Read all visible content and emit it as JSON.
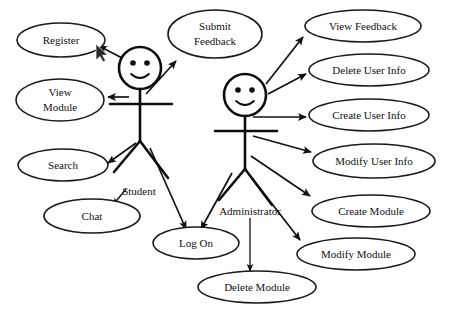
{
  "diagram": {
    "type": "uml-use-case-diagram",
    "background_color": "#ffffff",
    "stroke_color": "#111111",
    "actors": [
      {
        "id": "student",
        "label": "Student",
        "head": {
          "cx": 140,
          "cy": 68,
          "r": 21
        },
        "label_pos": {
          "x": 139,
          "y": 192
        }
      },
      {
        "id": "administrator",
        "label": "Administrator",
        "head": {
          "cx": 245,
          "cy": 95,
          "r": 21
        },
        "label_pos": {
          "x": 250,
          "y": 212
        }
      }
    ],
    "use_cases": [
      {
        "id": "register",
        "label": "Register",
        "lines": [
          "Register"
        ],
        "cx": 61,
        "cy": 40,
        "rx": 44,
        "ry": 17,
        "actor": "student"
      },
      {
        "id": "submit-feedback",
        "label": "Submit Feedback",
        "lines": [
          "Submit",
          "Feedback"
        ],
        "cx": 215,
        "cy": 34,
        "rx": 47,
        "ry": 24,
        "actor": "student"
      },
      {
        "id": "view-module",
        "label": "View Module",
        "lines": [
          "View",
          "Module"
        ],
        "cx": 60,
        "cy": 100,
        "rx": 44,
        "ry": 21,
        "actor": "student"
      },
      {
        "id": "search",
        "label": "Search",
        "lines": [
          "Search"
        ],
        "cx": 63,
        "cy": 165,
        "rx": 45,
        "ry": 16,
        "actor": "student"
      },
      {
        "id": "chat",
        "label": "Chat",
        "lines": [
          "Chat"
        ],
        "cx": 92,
        "cy": 216,
        "rx": 48,
        "ry": 17,
        "actor": "student"
      },
      {
        "id": "log-on",
        "label": "Log On",
        "lines": [
          "Log On"
        ],
        "cx": 196,
        "cy": 243,
        "rx": 43,
        "ry": 16,
        "actor": "both"
      },
      {
        "id": "view-feedback",
        "label": "View Feedback",
        "lines": [
          "View Feedback"
        ],
        "cx": 363,
        "cy": 26,
        "rx": 58,
        "ry": 16,
        "actor": "administrator"
      },
      {
        "id": "delete-user-info",
        "label": "Delete User Info",
        "lines": [
          "Delete User Info"
        ],
        "cx": 369,
        "cy": 70,
        "rx": 60,
        "ry": 16,
        "actor": "administrator"
      },
      {
        "id": "create-user-info",
        "label": "Create User Info",
        "lines": [
          "Create User Info"
        ],
        "cx": 369,
        "cy": 115,
        "rx": 60,
        "ry": 16,
        "actor": "administrator"
      },
      {
        "id": "modify-user-info",
        "label": "Modify User Info",
        "lines": [
          "Modify User Info"
        ],
        "cx": 374,
        "cy": 161,
        "rx": 61,
        "ry": 17,
        "actor": "administrator"
      },
      {
        "id": "create-module",
        "label": "Create Module",
        "lines": [
          "Create Module"
        ],
        "cx": 371,
        "cy": 211,
        "rx": 59,
        "ry": 16,
        "actor": "administrator"
      },
      {
        "id": "modify-module",
        "label": "Modify Module",
        "lines": [
          "Modify Module"
        ],
        "cx": 356,
        "cy": 254,
        "rx": 59,
        "ry": 16,
        "actor": "administrator"
      },
      {
        "id": "delete-module",
        "label": "Delete Module",
        "lines": [
          "Delete Module"
        ],
        "cx": 257,
        "cy": 287,
        "rx": 59,
        "ry": 16,
        "actor": "administrator"
      }
    ],
    "associations": [
      {
        "id": "student-register",
        "from": "student",
        "to": "register",
        "label": ""
      },
      {
        "id": "student-submit-feedback",
        "from": "student",
        "to": "submit-feedback",
        "label": ""
      },
      {
        "id": "student-view-module",
        "from": "student",
        "to": "view-module",
        "label": ""
      },
      {
        "id": "student-search",
        "from": "student",
        "to": "search",
        "label": ""
      },
      {
        "id": "student-chat",
        "from": "student",
        "to": "chat",
        "label": ""
      },
      {
        "id": "student-log-on",
        "from": "student",
        "to": "log-on",
        "label": ""
      },
      {
        "id": "admin-view-feedback",
        "from": "administrator",
        "to": "view-feedback",
        "label": ""
      },
      {
        "id": "admin-delete-user-info",
        "from": "administrator",
        "to": "delete-user-info",
        "label": ""
      },
      {
        "id": "admin-create-user-info",
        "from": "administrator",
        "to": "create-user-info",
        "label": ""
      },
      {
        "id": "admin-modify-user-info",
        "from": "administrator",
        "to": "modify-user-info",
        "label": ""
      },
      {
        "id": "admin-create-module",
        "from": "administrator",
        "to": "create-module",
        "label": ""
      },
      {
        "id": "admin-modify-module",
        "from": "administrator",
        "to": "modify-module",
        "label": ""
      },
      {
        "id": "admin-delete-module",
        "from": "administrator",
        "to": "delete-module",
        "label": ""
      },
      {
        "id": "admin-log-on",
        "from": "administrator",
        "to": "log-on",
        "label": ""
      }
    ]
  }
}
